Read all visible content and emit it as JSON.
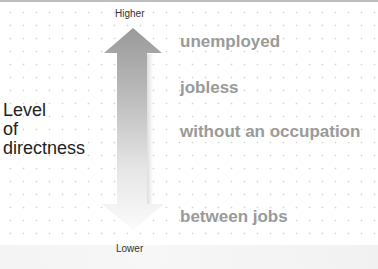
{
  "diagram": {
    "scale_top_label": "Higher",
    "scale_bottom_label": "Lower",
    "axis_label_lines": [
      "Level",
      "of",
      "directness"
    ],
    "items": [
      {
        "label": "unemployed",
        "y": 32
      },
      {
        "label": "jobless",
        "y": 78
      },
      {
        "label": "without an occupation",
        "y": 122
      },
      {
        "label": "between jobs",
        "y": 207
      }
    ],
    "arrow": {
      "direction": "vertical-bidirectional",
      "top_color": "#9a9a9a",
      "bottom_color": "#fafafa"
    },
    "colors": {
      "item_text": "#9a9a9a",
      "label_text": "#222222",
      "grid_dot": "#d6d6d6"
    }
  }
}
